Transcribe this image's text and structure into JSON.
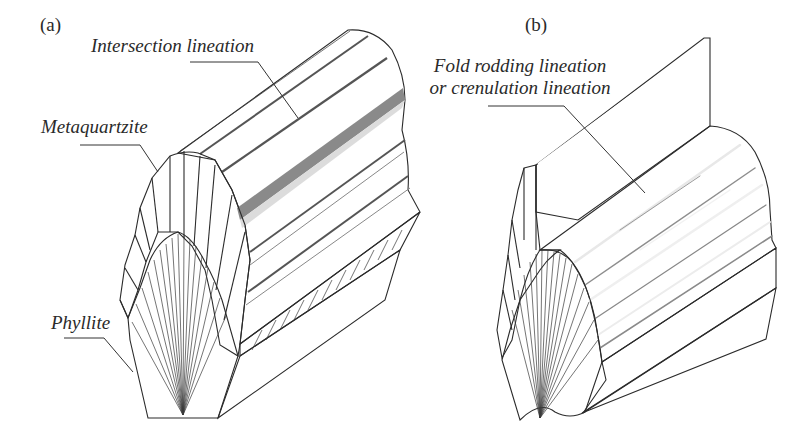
{
  "figure": {
    "panels": [
      {
        "id": "a",
        "label": "(a)",
        "annotations": [
          {
            "text": "Intersection lineation"
          },
          {
            "text": "Metaquartzite"
          },
          {
            "text": "Phyllite"
          }
        ]
      },
      {
        "id": "b",
        "label": "(b)",
        "annotations": [
          {
            "line1": "Fold rodding lineation",
            "line2": "or crenulation lineation"
          }
        ]
      }
    ],
    "colors": {
      "metaquartzite": "#8f8f8f",
      "phyllite": "#b5b5b5",
      "top_face_white": "#ffffff",
      "groove_dark": "#6e6e6e",
      "front_face_light": "#e9e9e9",
      "axial_plane": "#9a9a9a",
      "crenulated_surface": "#c4c4c4"
    }
  }
}
